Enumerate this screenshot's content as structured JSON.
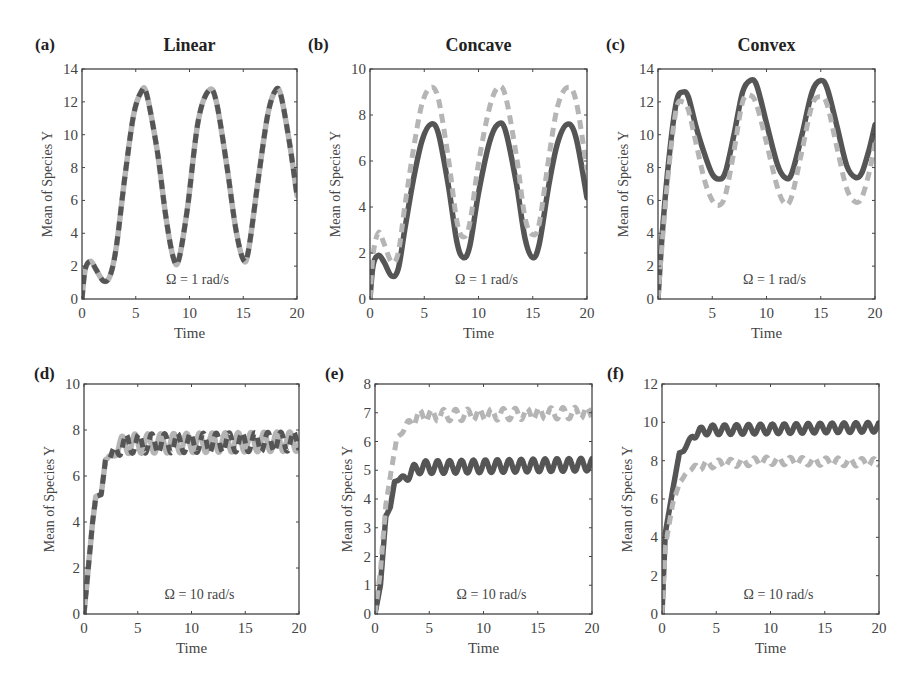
{
  "figure": {
    "colors": {
      "dark": "#555555",
      "light": "#b5b5b5",
      "axis": "#444444"
    }
  },
  "chart_data": [
    {
      "id": "a",
      "letter": "(a)",
      "title": "Linear",
      "type": "line",
      "xlabel": "Time",
      "ylabel": "Mean of Species Y",
      "xlim": [
        0,
        20
      ],
      "ylim": [
        0,
        14
      ],
      "xticks": [
        0,
        5,
        10,
        15,
        20
      ],
      "yticks": [
        0,
        2,
        4,
        6,
        8,
        10,
        12,
        14
      ],
      "annotation": "Ω = 1 rad/s",
      "grid": false,
      "frame": {
        "left": 82,
        "top": 69,
        "right": 297,
        "bottom": 299
      },
      "series": [
        {
          "name": "light solid",
          "style": "light-solid",
          "x": [
            0,
            0.3,
            0.8,
            1.3,
            2,
            2.6,
            3.2,
            4,
            4.8,
            5.5,
            6,
            7,
            7.8,
            8.5,
            9,
            9.8,
            10.8,
            11.8,
            12.5,
            13.5,
            14.3,
            15,
            15.5,
            16.5,
            17.3,
            18,
            18.5,
            19.3,
            20
          ],
          "y": [
            0,
            1.8,
            2.3,
            1.8,
            1.1,
            1.4,
            3.2,
            7.5,
            11.2,
            12.6,
            12.5,
            9,
            5,
            2.5,
            2.4,
            5.5,
            10.8,
            12.7,
            12,
            8,
            4.3,
            2.4,
            3,
            7.8,
            11.3,
            12.7,
            12.4,
            9.5,
            6.3
          ]
        },
        {
          "name": "dark dashed",
          "style": "dark-dashed",
          "x": [
            0,
            0.3,
            0.8,
            1.3,
            2,
            2.6,
            3.2,
            4,
            4.8,
            5.5,
            6,
            7,
            7.8,
            8.5,
            9,
            9.8,
            10.8,
            11.8,
            12.5,
            13.5,
            14.3,
            15,
            15.5,
            16.5,
            17.3,
            18,
            18.5,
            19.3,
            20
          ],
          "y": [
            0,
            1.8,
            2.3,
            1.8,
            1.1,
            1.4,
            3.2,
            7.5,
            11.2,
            12.6,
            12.5,
            9,
            5,
            2.5,
            2.4,
            5.5,
            10.8,
            12.7,
            12,
            8,
            4.3,
            2.4,
            3,
            7.8,
            11.3,
            12.7,
            12.4,
            9.5,
            6.3
          ]
        }
      ]
    },
    {
      "id": "b",
      "letter": "(b)",
      "title": "Concave",
      "type": "line",
      "xlabel": "Time",
      "ylabel": "Mean of Species Y",
      "xlim": [
        0,
        20
      ],
      "ylim": [
        0,
        10
      ],
      "xticks": [
        0,
        5,
        10,
        15,
        20
      ],
      "yticks": [
        0,
        2,
        4,
        6,
        8,
        10
      ],
      "annotation": "Ω = 1 rad/s",
      "grid": false,
      "frame": {
        "left": 370,
        "top": 69,
        "right": 587,
        "bottom": 299
      },
      "series": [
        {
          "name": "dark solid",
          "style": "dark-solid",
          "x": [
            0,
            0.3,
            0.8,
            1.3,
            2,
            2.6,
            3.2,
            4,
            4.8,
            5.6,
            6.3,
            7.2,
            8,
            8.6,
            9.2,
            10,
            11,
            11.8,
            12.5,
            13.5,
            14.3,
            15,
            15.6,
            16.5,
            17.3,
            18.2,
            19,
            20
          ],
          "y": [
            0,
            1.5,
            1.9,
            1.6,
            1.0,
            1.3,
            3,
            5.2,
            6.9,
            7.6,
            7.2,
            5,
            2.5,
            1.8,
            2.3,
            4.6,
            6.8,
            7.6,
            7.3,
            5,
            2.6,
            1.8,
            2.4,
            5,
            6.8,
            7.6,
            7.0,
            4.4
          ]
        },
        {
          "name": "light dashed",
          "style": "light-dashed",
          "x": [
            0,
            0.3,
            0.8,
            1.3,
            2,
            2.6,
            3.2,
            4,
            4.8,
            5.6,
            6.3,
            7.2,
            8,
            8.6,
            9.2,
            10,
            11,
            11.8,
            12.5,
            13.5,
            14.3,
            15,
            15.6,
            16.5,
            17.3,
            18.2,
            19,
            20
          ],
          "y": [
            0,
            2,
            2.9,
            2.4,
            1.6,
            2,
            4,
            6.5,
            8.5,
            9.2,
            8.7,
            6.2,
            3.4,
            2.7,
            3.3,
            5.9,
            8.3,
            9.2,
            8.8,
            6.2,
            3.5,
            2.8,
            3.3,
            6.2,
            8.4,
            9.2,
            8.6,
            5.6
          ]
        }
      ]
    },
    {
      "id": "c",
      "letter": "(c)",
      "title": "Convex",
      "type": "line",
      "xlabel": "Time",
      "ylabel": "Mean of Species Y",
      "xlim": [
        0,
        20
      ],
      "ylim": [
        0,
        14
      ],
      "xticks": [
        5,
        10,
        15,
        20
      ],
      "yticks": [
        0,
        2,
        4,
        6,
        8,
        10,
        12,
        14
      ],
      "annotation": "Ω = 1 rad/s",
      "grid": false,
      "frame": {
        "left": 658,
        "top": 69,
        "right": 875,
        "bottom": 299
      },
      "series": [
        {
          "name": "dark solid",
          "style": "dark-solid",
          "x": [
            0,
            0.4,
            1,
            1.7,
            2.3,
            2.8,
            3.5,
            4.3,
            5,
            5.6,
            6.2,
            7,
            7.8,
            8.5,
            9.1,
            10,
            11,
            11.7,
            12.3,
            13.2,
            14.2,
            15,
            15.6,
            16.5,
            17.4,
            18.2,
            18.8,
            19.5,
            20
          ],
          "y": [
            0,
            4,
            8.5,
            12,
            12.6,
            12.3,
            10.5,
            8.8,
            7.6,
            7.3,
            7.7,
            10,
            12.6,
            13.3,
            13,
            10.7,
            8.2,
            7.4,
            7.6,
            9.8,
            12.6,
            13.3,
            12.8,
            10.5,
            8.1,
            7.4,
            7.7,
            9.2,
            10.6
          ]
        },
        {
          "name": "light dashed",
          "style": "light-dashed",
          "x": [
            0,
            0.4,
            1,
            1.7,
            2.3,
            2.8,
            3.5,
            4.3,
            5,
            5.6,
            6.2,
            7,
            7.8,
            8.5,
            9.1,
            10,
            11,
            11.7,
            12.3,
            13.2,
            14.2,
            15,
            15.6,
            16.5,
            17.4,
            18.2,
            18.8,
            19.5,
            20
          ],
          "y": [
            0,
            3.5,
            8,
            11.6,
            12,
            11.5,
            9.5,
            7.2,
            6,
            5.7,
            6.3,
            9,
            12,
            12.4,
            11.8,
            9.5,
            6.8,
            5.8,
            6.2,
            8.8,
            11.8,
            12.3,
            11.8,
            9.2,
            6.7,
            5.9,
            6.2,
            7.8,
            9.5
          ]
        }
      ]
    },
    {
      "id": "d",
      "letter": "(d)",
      "title": "",
      "type": "line",
      "xlabel": "Time",
      "ylabel": "Mean of Species Y",
      "xlim": [
        0,
        20
      ],
      "ylim": [
        0,
        10
      ],
      "xticks": [
        0,
        5,
        10,
        15,
        20
      ],
      "yticks": [
        0,
        2,
        4,
        6,
        8,
        10
      ],
      "annotation": "Ω = 10 rad/s",
      "grid": false,
      "frame": {
        "left": 84,
        "top": 384,
        "right": 299,
        "bottom": 614
      },
      "series": [
        {
          "name": "light solid",
          "style": "light-solid",
          "baseline": [
            [
              0,
              0
            ],
            [
              0.3,
              1.5
            ],
            [
              0.8,
              4
            ],
            [
              1.1,
              5.1
            ],
            [
              1.6,
              5.2
            ],
            [
              2,
              6.7
            ],
            [
              2.5,
              6.8
            ],
            [
              3,
              7.2
            ],
            [
              4,
              7.4
            ],
            [
              20,
              7.5
            ]
          ],
          "osc_amp": 0.42,
          "osc_period": 1.2,
          "osc_phase": 0.3
        },
        {
          "name": "dark dashed",
          "style": "dark-dashed",
          "baseline": [
            [
              0,
              0
            ],
            [
              0.3,
              1.5
            ],
            [
              0.8,
              4
            ],
            [
              1.1,
              5.1
            ],
            [
              1.6,
              5.2
            ],
            [
              2,
              6.7
            ],
            [
              2.5,
              6.8
            ],
            [
              3,
              7.2
            ],
            [
              4,
              7.4
            ],
            [
              20,
              7.5
            ]
          ],
          "osc_amp": 0.42,
          "osc_period": 1.2,
          "osc_phase": 0.0
        }
      ]
    },
    {
      "id": "e",
      "letter": "(e)",
      "title": "",
      "type": "line",
      "xlabel": "Time",
      "ylabel": "Mean of Species Y",
      "xlim": [
        0,
        20
      ],
      "ylim": [
        0,
        8
      ],
      "xticks": [
        0,
        5,
        10,
        15,
        20
      ],
      "yticks": [
        0,
        1,
        2,
        3,
        4,
        5,
        6,
        7,
        8
      ],
      "annotation": "Ω = 10 rad/s",
      "grid": false,
      "frame": {
        "left": 375,
        "top": 384,
        "right": 592,
        "bottom": 614
      },
      "series": [
        {
          "name": "dark solid",
          "style": "dark-solid",
          "baseline": [
            [
              0,
              0
            ],
            [
              0.5,
              1
            ],
            [
              1,
              3.4
            ],
            [
              1.4,
              3.7
            ],
            [
              1.8,
              4.6
            ],
            [
              2.4,
              4.7
            ],
            [
              3,
              4.8
            ],
            [
              4,
              5.1
            ],
            [
              20,
              5.2
            ]
          ],
          "osc_amp": 0.22,
          "osc_period": 1.1,
          "osc_phase": 0
        },
        {
          "name": "light dashed",
          "style": "light-dashed",
          "baseline": [
            [
              0,
              0
            ],
            [
              0.5,
              1.5
            ],
            [
              1,
              3.8
            ],
            [
              1.5,
              5
            ],
            [
              2,
              6.1
            ],
            [
              2.8,
              6.5
            ],
            [
              4,
              6.9
            ],
            [
              20,
              7.0
            ]
          ],
          "osc_amp": 0.2,
          "osc_period": 1.1,
          "osc_phase": 0.5
        }
      ]
    },
    {
      "id": "f",
      "letter": "(f)",
      "title": "",
      "type": "line",
      "xlabel": "Time",
      "ylabel": "Mean of Species Y",
      "xlim": [
        0,
        20
      ],
      "ylim": [
        0,
        12
      ],
      "xticks": [
        0,
        5,
        10,
        15,
        20
      ],
      "yticks": [
        0,
        2,
        4,
        6,
        8,
        10,
        12
      ],
      "annotation": "Ω = 10 rad/s",
      "grid": false,
      "frame": {
        "left": 662,
        "top": 384,
        "right": 879,
        "bottom": 614
      },
      "series": [
        {
          "name": "dark solid",
          "style": "dark-solid",
          "baseline": [
            [
              0,
              0
            ],
            [
              0.3,
              4.2
            ],
            [
              1,
              6.5
            ],
            [
              1.6,
              8.4
            ],
            [
              2,
              8.5
            ],
            [
              2.8,
              9.3
            ],
            [
              4,
              9.6
            ],
            [
              20,
              9.75
            ]
          ],
          "osc_amp": 0.25,
          "osc_period": 1.1,
          "osc_phase": 0
        },
        {
          "name": "light dashed",
          "style": "light-dashed",
          "baseline": [
            [
              0,
              0
            ],
            [
              0.3,
              3.5
            ],
            [
              1,
              5.8
            ],
            [
              1.6,
              6.8
            ],
            [
              2.4,
              7.5
            ],
            [
              4,
              7.8
            ],
            [
              10,
              8
            ],
            [
              20,
              7.9
            ]
          ],
          "osc_amp": 0.2,
          "osc_period": 1.1,
          "osc_phase": 0.5
        }
      ]
    }
  ]
}
